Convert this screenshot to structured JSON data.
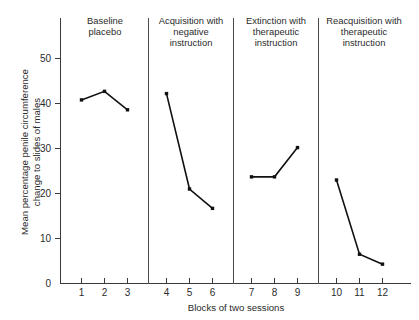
{
  "chart_data": {
    "type": "line",
    "title": "",
    "xlabel": "Blocks of two sessions",
    "ylabel": "Mean percentage penile circumference change to slides of males",
    "ylabel_line1": "Mean percentage penile circumference",
    "ylabel_line2": "change to slides of males",
    "xlim": [
      0.4,
      12.6
    ],
    "ylim": [
      0,
      54
    ],
    "yticks": [
      0,
      10,
      20,
      30,
      40,
      50
    ],
    "ytick_labels": [
      "0",
      "10",
      "20",
      "30",
      "40",
      "50"
    ],
    "xticks": [
      1,
      2,
      3,
      4,
      5,
      6,
      7,
      8,
      9,
      10,
      11,
      12
    ],
    "xtick_labels": [
      "1",
      "2",
      "3",
      "4",
      "5",
      "6",
      "7",
      "8",
      "9",
      "10",
      "11",
      "12"
    ],
    "grid": false,
    "legend": "none",
    "marker": "square",
    "line_color": "#111111",
    "panels": [
      {
        "name": "baseline-placebo",
        "title": "Baseline placebo",
        "title_lines": [
          "Baseline",
          "placebo"
        ],
        "x": [
          1,
          2,
          3
        ],
        "values": [
          40.8,
          42.7,
          38.6
        ]
      },
      {
        "name": "acquisition-negative",
        "title": "Acquisition with negative instruction",
        "title_lines": [
          "Acquisition with",
          "negative",
          "instruction"
        ],
        "x": [
          4,
          5,
          6
        ],
        "values": [
          42.2,
          21.0,
          16.7
        ]
      },
      {
        "name": "extinction-therapeutic",
        "title": "Extinction with therapeutic instruction",
        "title_lines": [
          "Extinction with",
          "therapeutic",
          "instruction"
        ],
        "x": [
          7,
          8,
          9
        ],
        "values": [
          23.7,
          23.7,
          30.2
        ]
      },
      {
        "name": "reacquisition-therapeutic",
        "title": "Reacquisition with therapeutic instruction",
        "title_lines": [
          "Reacquisition with",
          "therapeutic",
          "instruction"
        ],
        "x": [
          10,
          11,
          12
        ],
        "values": [
          23.0,
          6.5,
          4.3
        ]
      }
    ],
    "panel_dividers_after_x": [
      3.5,
      6.5,
      9.5
    ]
  }
}
